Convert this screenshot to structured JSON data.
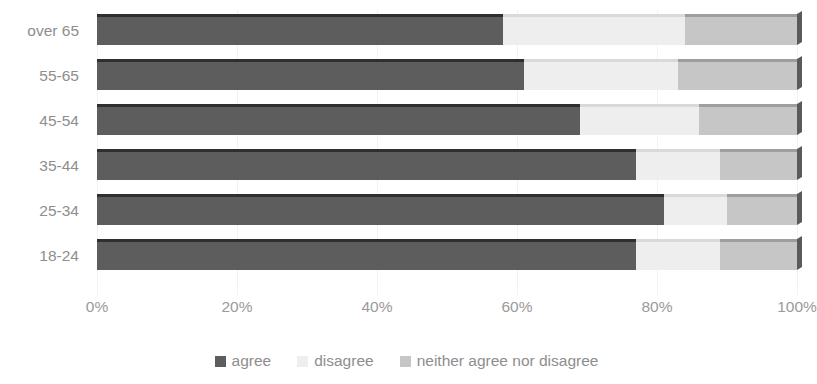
{
  "chart_data": {
    "type": "bar",
    "orientation": "horizontal",
    "stacked": true,
    "stack_mode": "percent",
    "title": "",
    "subtitle": "",
    "xlabel": "",
    "ylabel": "",
    "xlim": [
      0,
      100
    ],
    "xticks": [
      0,
      20,
      40,
      60,
      80,
      100
    ],
    "xtick_labels": [
      "0%",
      "20%",
      "40%",
      "60%",
      "80%",
      "100%"
    ],
    "grid": true,
    "grid_axis": "x",
    "legend_position": "bottom",
    "categories": [
      "18-24",
      "25-34",
      "35-44",
      "45-54",
      "55-65",
      "over 65"
    ],
    "series": [
      {
        "name": "agree",
        "color": "#5d5d5d",
        "values": [
          77,
          81,
          77,
          69,
          61,
          58
        ]
      },
      {
        "name": "disagree",
        "color": "#eeeeee",
        "values": [
          12,
          9,
          12,
          17,
          22,
          26
        ]
      },
      {
        "name": "neither agree nor disagree",
        "color": "#c6c6c6",
        "values": [
          11,
          10,
          11,
          14,
          17,
          16
        ]
      }
    ]
  },
  "axis": {
    "y_categories_top_to_bottom": [
      "over 65",
      "55-65",
      "45-54",
      "35-44",
      "25-34",
      "18-24"
    ],
    "x_tick_labels": [
      "0%",
      "20%",
      "40%",
      "60%",
      "80%",
      "100%"
    ]
  },
  "legend": {
    "items": [
      {
        "label": "agree",
        "color": "#5d5d5d"
      },
      {
        "label": "disagree",
        "color": "#eeeeee"
      },
      {
        "label": "neither agree nor disagree",
        "color": "#c6c6c6"
      }
    ]
  },
  "colors": {
    "agree": "#5d5d5d",
    "disagree": "#eeeeee",
    "neither": "#c6c6c6",
    "axis_text": "#8e8e8e",
    "gridline": "#f2f2f2",
    "background": "#ffffff"
  }
}
